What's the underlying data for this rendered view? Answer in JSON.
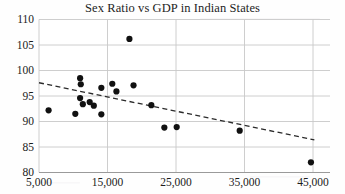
{
  "chart_data": {
    "type": "scatter",
    "title": "Sex Ratio vs GDP in Indian States",
    "xlabel": "",
    "ylabel": "",
    "xlim": [
      5000,
      48000
    ],
    "ylim": [
      80,
      110
    ],
    "grid": true,
    "legend": "none",
    "x_ticks": [
      "5,000",
      "15,000",
      "25,000",
      "35,000",
      "45,000"
    ],
    "x_tick_values": [
      5000,
      15000,
      25000,
      35000,
      45000
    ],
    "y_ticks": [
      "80",
      "85",
      "90",
      "95",
      "100",
      "105",
      "110"
    ],
    "y_tick_values": [
      80,
      85,
      90,
      95,
      100,
      105,
      110
    ],
    "marker": "filled-circle",
    "marker_color": "#111111",
    "points": [
      {
        "x": 6400,
        "y": 92.2
      },
      {
        "x": 11000,
        "y": 98.5
      },
      {
        "x": 11100,
        "y": 97.3
      },
      {
        "x": 11000,
        "y": 94.6
      },
      {
        "x": 11400,
        "y": 93.4
      },
      {
        "x": 12400,
        "y": 93.8
      },
      {
        "x": 13000,
        "y": 93.1
      },
      {
        "x": 10300,
        "y": 91.5
      },
      {
        "x": 14100,
        "y": 96.6
      },
      {
        "x": 15700,
        "y": 97.4
      },
      {
        "x": 16300,
        "y": 95.9
      },
      {
        "x": 14100,
        "y": 91.4
      },
      {
        "x": 18200,
        "y": 106.2
      },
      {
        "x": 18800,
        "y": 97.1
      },
      {
        "x": 21400,
        "y": 93.2
      },
      {
        "x": 23300,
        "y": 88.8
      },
      {
        "x": 25100,
        "y": 88.9
      },
      {
        "x": 34300,
        "y": 88.2
      },
      {
        "x": 44700,
        "y": 82.0
      }
    ],
    "trendline": {
      "style": "dashed",
      "color": "#2b2b2b",
      "x_start": 5000,
      "y_start": 97.6,
      "x_end": 45200,
      "y_end": 86.4
    }
  }
}
